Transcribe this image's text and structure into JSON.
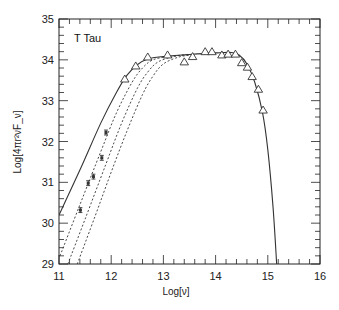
{
  "chart_data": {
    "type": "scatter",
    "title": "T Tau",
    "xlabel": "Log[ν]",
    "ylabel": "Log[4πr²νF_ν]",
    "xlim": [
      11,
      16
    ],
    "ylim": [
      29,
      35
    ],
    "xticks": [
      11,
      12,
      13,
      14,
      15,
      16
    ],
    "yticks": [
      29,
      30,
      31,
      32,
      33,
      34,
      35
    ],
    "x_minor_step": 0.2,
    "y_minor_step": 0.2,
    "grid": false,
    "series": [
      {
        "name": "photometry (triangles)",
        "marker": "open-triangle",
        "x": [
          12.26,
          12.47,
          12.7,
          13.08,
          13.4,
          13.56,
          13.8,
          13.93,
          14.12,
          14.24,
          14.38,
          14.5,
          14.61,
          14.7,
          14.82,
          14.91
        ],
        "y": [
          33.53,
          33.85,
          34.07,
          34.12,
          33.95,
          34.08,
          34.2,
          34.2,
          34.12,
          34.14,
          34.14,
          33.93,
          33.82,
          33.59,
          33.28,
          32.77
        ]
      },
      {
        "name": "mm/submm data (error bars)",
        "marker": "filled-square-errorbar",
        "x": [
          11.41,
          11.56,
          11.66,
          11.82,
          11.9
        ],
        "y": [
          30.32,
          30.98,
          31.14,
          31.6,
          32.22
        ],
        "yerr": [
          0.06,
          0.06,
          0.06,
          0.06,
          0.06
        ]
      },
      {
        "name": "model (solid)",
        "style": "solid",
        "x": [
          11.0,
          11.4,
          11.8,
          12.1,
          12.3,
          12.5,
          12.7,
          13.0,
          13.5,
          14.0,
          14.3,
          14.45,
          14.6,
          14.75,
          14.9,
          15.0,
          15.1,
          15.17
        ],
        "y": [
          30.2,
          31.3,
          32.45,
          33.2,
          33.62,
          33.88,
          34.02,
          34.08,
          34.13,
          34.17,
          34.18,
          34.12,
          33.9,
          33.45,
          32.7,
          31.8,
          30.4,
          29.0
        ]
      },
      {
        "name": "model (dotted 1)",
        "style": "dotted",
        "x": [
          11.02,
          11.4,
          11.8,
          12.1,
          12.4,
          12.6,
          12.8,
          13.1,
          13.5
        ],
        "y": [
          29.2,
          30.45,
          31.75,
          32.7,
          33.45,
          33.8,
          34.0,
          34.08,
          34.13
        ]
      },
      {
        "name": "model (dotted 2)",
        "style": "dotted",
        "x": [
          11.17,
          11.5,
          11.9,
          12.2,
          12.5,
          12.7,
          12.9,
          13.2,
          13.5
        ],
        "y": [
          29.0,
          30.1,
          31.45,
          32.45,
          33.3,
          33.7,
          33.95,
          34.08,
          34.13
        ]
      },
      {
        "name": "model (dotted 3)",
        "style": "dotted",
        "x": [
          11.35,
          11.7,
          12.0,
          12.3,
          12.6,
          12.8,
          13.0,
          13.3,
          13.6
        ],
        "y": [
          29.0,
          30.2,
          31.25,
          32.25,
          33.15,
          33.6,
          33.9,
          34.07,
          34.13
        ]
      }
    ],
    "annotations": [
      {
        "text": "T Tau",
        "x": 11.45,
        "y": 34.5
      }
    ]
  },
  "colors": {
    "axis": "#222222",
    "line": "#333333",
    "marker": "#333333"
  }
}
